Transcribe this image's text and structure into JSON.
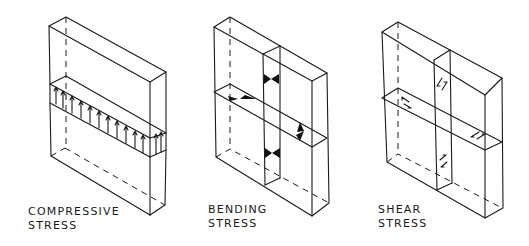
{
  "diagrams": [
    {
      "id": "compressive",
      "label_line1": "COMPRESSIVE",
      "label_line2": "STRESS"
    },
    {
      "id": "bending",
      "label_line1": "BENDING",
      "label_line2": "STRESS"
    },
    {
      "id": "shear",
      "label_line1": "SHEAR",
      "label_line2": "STRESS"
    }
  ],
  "colors": {
    "ink": "#1a1a1a",
    "background": "#ffffff"
  }
}
